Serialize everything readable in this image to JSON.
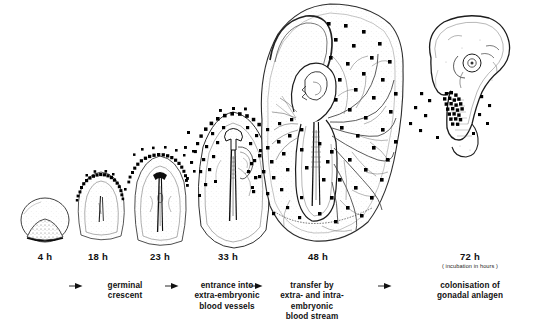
{
  "figure": {
    "background_color": "#ffffff",
    "ink_color": "#1a1a1a",
    "germ_cell_color": "#000000",
    "stipple_color": "#8d8d8d"
  },
  "stages": [
    {
      "id": "stage-4h",
      "label": "4 h",
      "description": "blastoderm with germ-cell region at posterior margin",
      "label_x": 45,
      "label_y": 256
    },
    {
      "id": "stage-18h",
      "label": "18 h",
      "description": "germinal crescent anterior to head process",
      "label_x": 98,
      "label_y": 256
    },
    {
      "id": "stage-23h",
      "label": "23 h",
      "description": "head fold stage, germ cells still in crescent",
      "label_x": 160,
      "label_y": 256
    },
    {
      "id": "stage-33h",
      "label": "33 h",
      "description": "germ cells entering extra-embryonic blood vessels",
      "label_x": 228,
      "label_y": 256
    },
    {
      "id": "stage-48h",
      "label": "48 h",
      "description": "germ cells distributed in yolk sac vascular area",
      "label_x": 318,
      "label_y": 256
    },
    {
      "id": "stage-72h",
      "label": "72 h",
      "sublabel": "( incubation in hours )",
      "description": "germ cells colonising the gonadal anlagen",
      "label_x": 470,
      "label_y": 256,
      "sublabel_y": 268
    }
  ],
  "steps": [
    {
      "id": "step-germinal-crescent",
      "text": "germinal\ncrescent",
      "arrow_x": 76,
      "arrow_y": 286,
      "text_x": 125,
      "text_y": 281
    },
    {
      "id": "step-entrance-vessels",
      "text": "entrance into\nextra-embryonic\nblood vessels",
      "arrow_x": 172,
      "arrow_y": 286,
      "text_x": 227,
      "text_y": 281
    },
    {
      "id": "step-transfer-blood-stream",
      "text": "transfer by\nextra- and intra-\nembryonic\nblood stream",
      "arrow_x": 256,
      "arrow_y": 286,
      "text_x": 312,
      "text_y": 281
    },
    {
      "id": "step-colonisation",
      "text": "colonisation of gonadal anlagen",
      "arrow_x": 385,
      "arrow_y": 286,
      "text_x": 470,
      "text_y": 281
    }
  ],
  "icons": {
    "arrow": "right-arrow-icon"
  }
}
